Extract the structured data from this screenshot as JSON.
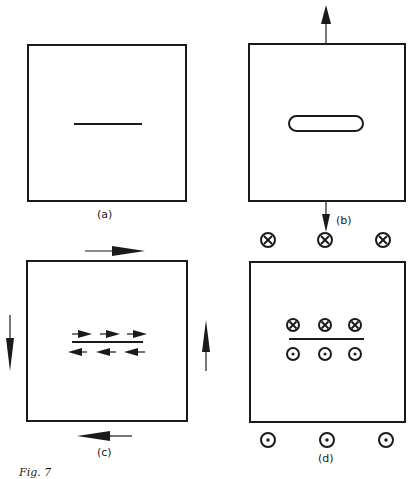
{
  "figure": {
    "caption": "Fig. 7",
    "panels": [
      {
        "id": "a",
        "label": "(a)",
        "description": "Plate with a central crack (line)"
      },
      {
        "id": "b",
        "label": "(b)",
        "description": "Mode I: crack opens under tensile load (arrows up/down)"
      },
      {
        "id": "c",
        "label": "(c)",
        "description": "Mode II: in-plane shear, faces slide in opposite directions"
      },
      {
        "id": "d",
        "label": "(d)",
        "description": "Mode III: out-of-plane shear (into/out of page symbols)"
      }
    ],
    "symbols": {
      "into_page": "⊗",
      "out_of_page": "⊙"
    }
  }
}
